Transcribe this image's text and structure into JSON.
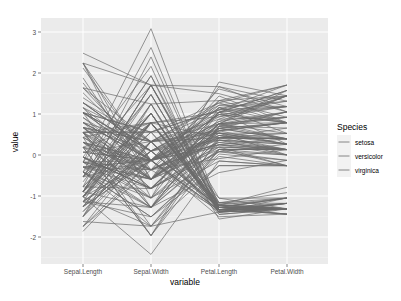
{
  "chart_data": {
    "type": "line",
    "title": "",
    "xlabel": "variable",
    "ylabel": "value",
    "categories": [
      "Sepal.Length",
      "Sepal.Width",
      "Petal.Length",
      "Petal.Width"
    ],
    "y_ticks": [
      -2,
      -1,
      0,
      1,
      2,
      3
    ],
    "ylim": [
      -2.55,
      3.45
    ],
    "grid": true,
    "legend": {
      "title": "Species",
      "position": "right",
      "entries": [
        "setosa",
        "versicolor",
        "virginica"
      ]
    },
    "line_color": "#6a6a6a",
    "standardized": true,
    "raw_series": {
      "setosa": [
        [
          5.1,
          3.5,
          1.4,
          0.2
        ],
        [
          4.9,
          3.0,
          1.4,
          0.2
        ],
        [
          4.7,
          3.2,
          1.3,
          0.2
        ],
        [
          4.6,
          3.1,
          1.5,
          0.2
        ],
        [
          5.0,
          3.6,
          1.4,
          0.2
        ],
        [
          5.4,
          3.9,
          1.7,
          0.4
        ],
        [
          4.6,
          3.4,
          1.4,
          0.3
        ],
        [
          5.0,
          3.4,
          1.5,
          0.2
        ],
        [
          4.4,
          2.9,
          1.4,
          0.2
        ],
        [
          4.9,
          3.1,
          1.5,
          0.1
        ],
        [
          5.4,
          3.7,
          1.5,
          0.2
        ],
        [
          4.8,
          3.4,
          1.6,
          0.2
        ],
        [
          4.8,
          3.0,
          1.4,
          0.1
        ],
        [
          4.3,
          3.0,
          1.1,
          0.1
        ],
        [
          5.8,
          4.0,
          1.2,
          0.2
        ],
        [
          5.7,
          4.4,
          1.5,
          0.4
        ],
        [
          5.4,
          3.9,
          1.3,
          0.4
        ],
        [
          5.1,
          3.5,
          1.4,
          0.3
        ],
        [
          5.7,
          3.8,
          1.7,
          0.3
        ],
        [
          5.1,
          3.8,
          1.5,
          0.3
        ],
        [
          5.4,
          3.4,
          1.7,
          0.2
        ],
        [
          5.1,
          3.7,
          1.5,
          0.4
        ],
        [
          4.6,
          3.6,
          1.0,
          0.2
        ],
        [
          5.1,
          3.3,
          1.7,
          0.5
        ],
        [
          4.8,
          3.4,
          1.9,
          0.2
        ],
        [
          5.0,
          3.0,
          1.6,
          0.2
        ],
        [
          5.0,
          3.4,
          1.6,
          0.4
        ],
        [
          5.2,
          3.5,
          1.5,
          0.2
        ],
        [
          5.2,
          3.4,
          1.4,
          0.2
        ],
        [
          4.7,
          3.2,
          1.6,
          0.2
        ],
        [
          4.8,
          3.1,
          1.6,
          0.2
        ],
        [
          5.4,
          3.4,
          1.5,
          0.4
        ],
        [
          5.2,
          4.1,
          1.5,
          0.1
        ],
        [
          5.5,
          4.2,
          1.4,
          0.2
        ],
        [
          4.9,
          3.1,
          1.5,
          0.2
        ],
        [
          5.0,
          3.2,
          1.2,
          0.2
        ],
        [
          5.5,
          3.5,
          1.3,
          0.2
        ],
        [
          4.9,
          3.6,
          1.4,
          0.1
        ],
        [
          4.4,
          3.0,
          1.3,
          0.2
        ],
        [
          5.1,
          3.4,
          1.5,
          0.2
        ],
        [
          5.0,
          3.5,
          1.3,
          0.3
        ],
        [
          4.5,
          2.3,
          1.3,
          0.3
        ],
        [
          4.4,
          3.2,
          1.3,
          0.2
        ],
        [
          5.0,
          3.5,
          1.6,
          0.6
        ],
        [
          5.1,
          3.8,
          1.9,
          0.4
        ],
        [
          4.8,
          3.0,
          1.4,
          0.3
        ],
        [
          5.1,
          3.8,
          1.6,
          0.2
        ],
        [
          4.6,
          3.2,
          1.4,
          0.2
        ],
        [
          5.3,
          3.7,
          1.5,
          0.2
        ],
        [
          5.0,
          3.3,
          1.4,
          0.2
        ]
      ],
      "versicolor": [
        [
          7.0,
          3.2,
          4.7,
          1.4
        ],
        [
          6.4,
          3.2,
          4.5,
          1.5
        ],
        [
          6.9,
          3.1,
          4.9,
          1.5
        ],
        [
          5.5,
          2.3,
          4.0,
          1.3
        ],
        [
          6.5,
          2.8,
          4.6,
          1.5
        ],
        [
          5.7,
          2.8,
          4.5,
          1.3
        ],
        [
          6.3,
          3.3,
          4.7,
          1.6
        ],
        [
          4.9,
          2.4,
          3.3,
          1.0
        ],
        [
          6.6,
          2.9,
          4.6,
          1.3
        ],
        [
          5.2,
          2.7,
          3.9,
          1.4
        ],
        [
          5.0,
          2.0,
          3.5,
          1.0
        ],
        [
          5.9,
          3.0,
          4.2,
          1.5
        ],
        [
          6.0,
          2.2,
          4.0,
          1.0
        ],
        [
          6.1,
          2.9,
          4.7,
          1.4
        ],
        [
          5.6,
          2.9,
          3.6,
          1.3
        ],
        [
          6.7,
          3.1,
          4.4,
          1.4
        ],
        [
          5.6,
          3.0,
          4.5,
          1.5
        ],
        [
          5.8,
          2.7,
          4.1,
          1.0
        ],
        [
          6.2,
          2.2,
          4.5,
          1.5
        ],
        [
          5.6,
          2.5,
          3.9,
          1.1
        ],
        [
          5.9,
          3.2,
          4.8,
          1.8
        ],
        [
          6.1,
          2.8,
          4.0,
          1.3
        ],
        [
          6.3,
          2.5,
          4.9,
          1.5
        ],
        [
          6.1,
          2.8,
          4.7,
          1.2
        ],
        [
          6.4,
          2.9,
          4.3,
          1.3
        ],
        [
          6.6,
          3.0,
          4.4,
          1.4
        ],
        [
          6.8,
          2.8,
          4.8,
          1.4
        ],
        [
          6.7,
          3.0,
          5.0,
          1.7
        ],
        [
          6.0,
          2.9,
          4.5,
          1.5
        ],
        [
          5.7,
          2.6,
          3.5,
          1.0
        ],
        [
          5.5,
          2.4,
          3.8,
          1.1
        ],
        [
          5.5,
          2.4,
          3.7,
          1.0
        ],
        [
          5.8,
          2.7,
          3.9,
          1.2
        ],
        [
          6.0,
          2.7,
          5.1,
          1.6
        ],
        [
          5.4,
          3.0,
          4.5,
          1.5
        ],
        [
          6.0,
          3.4,
          4.5,
          1.6
        ],
        [
          6.7,
          3.1,
          4.7,
          1.5
        ],
        [
          6.3,
          2.3,
          4.4,
          1.3
        ],
        [
          5.6,
          3.0,
          4.1,
          1.3
        ],
        [
          5.5,
          2.5,
          4.0,
          1.3
        ],
        [
          5.5,
          2.6,
          4.4,
          1.2
        ],
        [
          6.1,
          3.0,
          4.6,
          1.4
        ],
        [
          5.8,
          2.6,
          4.0,
          1.2
        ],
        [
          5.0,
          2.3,
          3.3,
          1.0
        ],
        [
          5.6,
          2.7,
          4.2,
          1.3
        ],
        [
          5.7,
          3.0,
          4.2,
          1.2
        ],
        [
          5.7,
          2.9,
          4.2,
          1.3
        ],
        [
          6.2,
          2.9,
          4.3,
          1.3
        ],
        [
          5.1,
          2.5,
          3.0,
          1.1
        ],
        [
          5.7,
          2.8,
          4.1,
          1.3
        ]
      ],
      "virginica": [
        [
          6.3,
          3.3,
          6.0,
          2.5
        ],
        [
          5.8,
          2.7,
          5.1,
          1.9
        ],
        [
          7.1,
          3.0,
          5.9,
          2.1
        ],
        [
          6.3,
          2.9,
          5.6,
          1.8
        ],
        [
          6.5,
          3.0,
          5.8,
          2.2
        ],
        [
          7.6,
          3.0,
          6.6,
          2.1
        ],
        [
          4.9,
          2.5,
          4.5,
          1.7
        ],
        [
          7.3,
          2.9,
          6.3,
          1.8
        ],
        [
          6.7,
          2.5,
          5.8,
          1.8
        ],
        [
          7.2,
          3.6,
          6.1,
          2.5
        ],
        [
          6.5,
          3.2,
          5.1,
          2.0
        ],
        [
          6.4,
          2.7,
          5.3,
          1.9
        ],
        [
          6.8,
          3.0,
          5.5,
          2.1
        ],
        [
          5.7,
          2.5,
          5.0,
          2.0
        ],
        [
          5.8,
          2.8,
          5.1,
          2.4
        ],
        [
          6.4,
          3.2,
          5.3,
          2.3
        ],
        [
          6.5,
          3.0,
          5.5,
          1.8
        ],
        [
          7.7,
          3.8,
          6.7,
          2.2
        ],
        [
          7.7,
          2.6,
          6.9,
          2.3
        ],
        [
          6.0,
          2.2,
          5.0,
          1.5
        ],
        [
          6.9,
          3.2,
          5.7,
          2.3
        ],
        [
          5.6,
          2.8,
          4.9,
          2.0
        ],
        [
          7.7,
          2.8,
          6.7,
          2.0
        ],
        [
          6.3,
          2.7,
          4.9,
          1.8
        ],
        [
          6.7,
          3.3,
          5.7,
          2.1
        ],
        [
          7.2,
          3.2,
          6.0,
          1.8
        ],
        [
          6.2,
          2.8,
          4.8,
          1.8
        ],
        [
          6.1,
          3.0,
          4.9,
          1.8
        ],
        [
          6.4,
          2.8,
          5.6,
          2.1
        ],
        [
          7.2,
          3.0,
          5.8,
          1.6
        ],
        [
          7.4,
          2.8,
          6.1,
          1.9
        ],
        [
          7.9,
          3.8,
          6.4,
          2.0
        ],
        [
          6.4,
          2.8,
          5.6,
          2.2
        ],
        [
          6.3,
          2.8,
          5.1,
          1.5
        ],
        [
          6.1,
          2.6,
          5.6,
          1.4
        ],
        [
          7.7,
          3.0,
          6.1,
          2.3
        ],
        [
          6.3,
          3.4,
          5.6,
          2.4
        ],
        [
          6.4,
          3.1,
          5.5,
          1.8
        ],
        [
          6.0,
          3.0,
          4.8,
          1.8
        ],
        [
          6.9,
          3.1,
          5.4,
          2.1
        ],
        [
          6.7,
          3.1,
          5.6,
          2.4
        ],
        [
          6.9,
          3.1,
          5.1,
          2.3
        ],
        [
          5.8,
          2.7,
          5.1,
          1.9
        ],
        [
          6.8,
          3.2,
          5.9,
          2.3
        ],
        [
          6.7,
          3.3,
          5.7,
          2.5
        ],
        [
          6.7,
          3.0,
          5.2,
          2.3
        ],
        [
          6.3,
          2.5,
          5.0,
          1.9
        ],
        [
          6.5,
          3.0,
          5.2,
          2.0
        ],
        [
          6.2,
          3.4,
          5.4,
          2.3
        ],
        [
          5.9,
          3.0,
          5.1,
          1.8
        ]
      ]
    }
  },
  "axes": {
    "xlabel": "variable",
    "ylabel": "value",
    "x_tick_labels": [
      "Sepal.Length",
      "Sepal.Width",
      "Petal.Length",
      "Petal.Width"
    ],
    "y_tick_labels": [
      "-2",
      "-1",
      "0",
      "1",
      "2",
      "3"
    ]
  },
  "legend": {
    "title": "Species",
    "items": [
      "setosa",
      "versicolor",
      "virginica"
    ]
  }
}
